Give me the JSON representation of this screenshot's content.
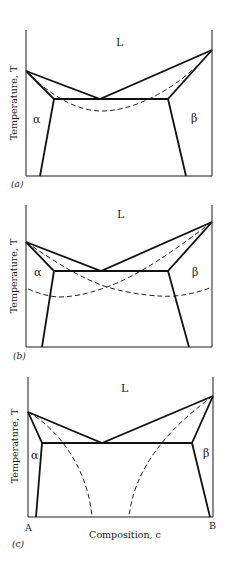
{
  "figure": {
    "y_axis_label": "Temperature, T",
    "x_axis_label": "Composition, c",
    "x_axis_ends": {
      "left": "A",
      "right": "B"
    },
    "colors": {
      "line": "#111111",
      "background": "#ffffff"
    }
  },
  "panels": [
    {
      "id": "a",
      "panel_label": "(a)",
      "phases": {
        "liquid": "L",
        "alpha": "α",
        "beta": "β"
      },
      "dashed_curve": "single curve between melting points dipping below eutectic"
    },
    {
      "id": "b",
      "panel_label": "(b)",
      "phases": {
        "liquid": "L",
        "alpha": "α",
        "beta": "β"
      },
      "dashed_curve": "two crossing curves extending across full composition range"
    },
    {
      "id": "c",
      "panel_label": "(c)",
      "phases": {
        "liquid": "L",
        "alpha": "α",
        "beta": "β"
      },
      "dashed_curve": "two curves descending steeply to bottom axis"
    }
  ]
}
